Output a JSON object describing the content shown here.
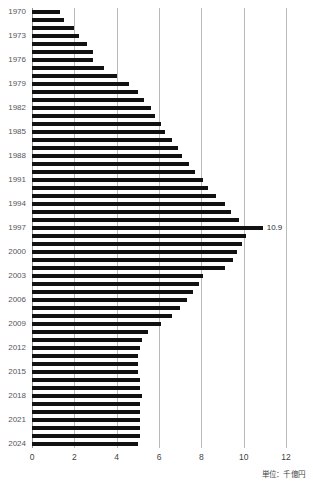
{
  "chart_data": {
    "type": "bar",
    "orientation": "horizontal",
    "title": "",
    "xlabel": "",
    "ylabel": "",
    "unit_label": "単位：千億円",
    "xlim": [
      0,
      12
    ],
    "x_ticks": [
      0,
      2,
      4,
      6,
      8,
      10,
      12
    ],
    "x_tick_labels": [
      "0",
      "2",
      "4",
      "6",
      "8",
      "10",
      "12"
    ],
    "grid": true,
    "grid_axis": "x",
    "legend": "none",
    "bar_color": "#111111",
    "annotations": [
      {
        "category": "1997",
        "value": 10.9,
        "text": "10.9"
      }
    ],
    "categories": [
      "1970",
      "1971",
      "1972",
      "1973",
      "1974",
      "1975",
      "1976",
      "1977",
      "1978",
      "1979",
      "1980",
      "1981",
      "1982",
      "1983",
      "1984",
      "1985",
      "1986",
      "1987",
      "1988",
      "1989",
      "1990",
      "1991",
      "1992",
      "1993",
      "1994",
      "1995",
      "1996",
      "1997",
      "1998",
      "1999",
      "2000",
      "2001",
      "2002",
      "2003",
      "2004",
      "2005",
      "2006",
      "2007",
      "2008",
      "2009",
      "2010",
      "2011",
      "2012",
      "2013",
      "2014",
      "2015",
      "2016",
      "2017",
      "2018",
      "2019",
      "2020",
      "2021",
      "2022",
      "2023",
      "2024"
    ],
    "values": [
      1.3,
      1.5,
      2.0,
      2.2,
      2.6,
      2.9,
      2.9,
      3.4,
      4.0,
      4.6,
      5.0,
      5.3,
      5.6,
      5.8,
      6.1,
      6.3,
      6.6,
      6.9,
      7.1,
      7.4,
      7.7,
      8.1,
      8.3,
      8.7,
      9.1,
      9.4,
      9.8,
      10.9,
      10.1,
      9.9,
      9.7,
      9.5,
      9.1,
      8.1,
      7.9,
      7.6,
      7.3,
      7.0,
      6.6,
      6.1,
      5.5,
      5.2,
      5.1,
      5.0,
      5.0,
      5.0,
      5.1,
      5.1,
      5.2,
      5.1,
      5.1,
      5.1,
      5.1,
      5.1,
      5.0
    ],
    "y_tick_labels": [
      "1970",
      "1973",
      "1976",
      "1979",
      "1982",
      "1985",
      "1988",
      "1991",
      "1994",
      "1997",
      "2000",
      "2003",
      "2006",
      "2009",
      "2012",
      "2015",
      "2018",
      "2021",
      "2024"
    ]
  }
}
